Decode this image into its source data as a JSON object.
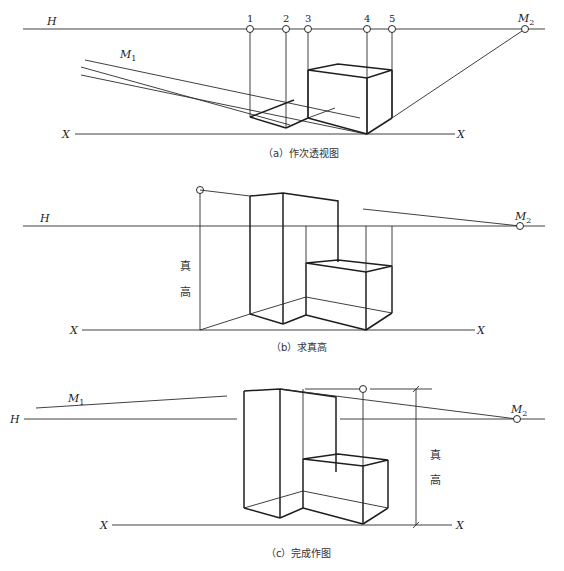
{
  "figure_a": {
    "caption": "（a）作次透视图",
    "horizon_label": "H",
    "ground_label_left": "X",
    "ground_label_right": "X",
    "measuring_point_1": "M",
    "measuring_point_1_sub": "1",
    "measuring_point_2": "M",
    "measuring_point_2_sub": "2",
    "points": [
      "1",
      "2",
      "3",
      "4",
      "5"
    ]
  },
  "figure_b": {
    "caption": "（b）求真高",
    "horizon_label": "H",
    "ground_label_left": "X",
    "ground_label_right": "X",
    "measuring_point_2": "M",
    "measuring_point_2_sub": "2",
    "true_height_char1": "真",
    "true_height_char2": "高"
  },
  "figure_c": {
    "caption": "（c）完成作图",
    "horizon_label": "H",
    "ground_label_left": "X",
    "ground_label_right": "X",
    "measuring_point_1": "M",
    "measuring_point_1_sub": "1",
    "measuring_point_2": "M",
    "measuring_point_2_sub": "2",
    "true_height_char1": "真",
    "true_height_char2": "高"
  }
}
